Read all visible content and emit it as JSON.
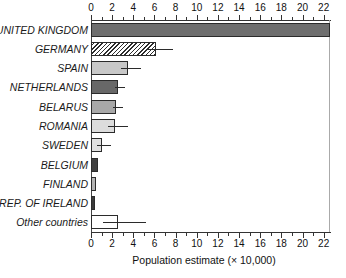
{
  "chart_data": {
    "type": "bar",
    "orientation": "horizontal",
    "title": "",
    "xlabel": "Population estimate (× 10,000)",
    "ylabel": "",
    "xlim": [
      0,
      22.6
    ],
    "xticks": [
      0,
      2,
      4,
      6,
      8,
      10,
      12,
      14,
      16,
      18,
      20,
      22
    ],
    "xtick_labels": [
      "0",
      "2",
      "4",
      "6",
      "8",
      "10",
      "12",
      "14",
      "16",
      "18",
      "20",
      "22"
    ],
    "minor_tick_interval": 1,
    "grid": false,
    "legend": null,
    "categories": [
      "UNITED KINGDOM",
      "GERMANY",
      "SPAIN",
      "NETHERLANDS",
      "BELARUS",
      "ROMANIA",
      "SWEDEN",
      "BELGIUM",
      "FINLAND",
      "REP. OF IRELAND",
      "Other countries"
    ],
    "values": [
      22.6,
      6.1,
      3.5,
      2.6,
      2.4,
      2.3,
      1.0,
      0.65,
      0.5,
      0.35,
      2.6
    ],
    "errors_upper": [
      0.0,
      1.7,
      1.2,
      0.6,
      0.6,
      1.2,
      0.85,
      0.0,
      0.0,
      0.0,
      2.6
    ],
    "bar_fills": [
      "#6e6e6e",
      "hatch",
      "#c8c8c8",
      "#686868",
      "#a8a8a8",
      "#dcdcdc",
      "#e0e0e0",
      "#3f3f3f",
      "#b4b4b4",
      "#3a3a3a",
      "#ffffff"
    ]
  },
  "colors": {
    "axis": "#333333",
    "bar_outline": "#2b2b2b",
    "text": "#1a1a1a",
    "background": "#ffffff"
  }
}
